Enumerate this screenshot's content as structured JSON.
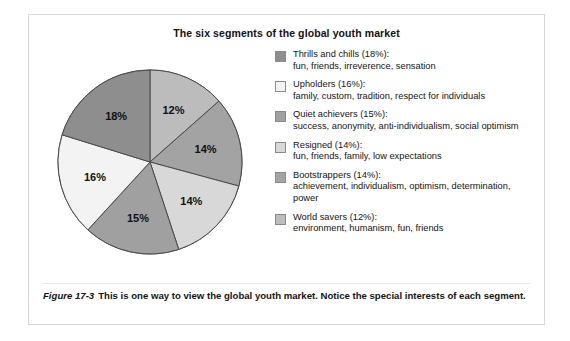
{
  "figure": {
    "title": "The six segments of the global youth market",
    "caption_label": "Figure 17-3",
    "caption_text": "This is one way to view the global youth market. Notice the special interests of each segment."
  },
  "legend": {
    "items": [
      {
        "head": "Thrills and chills (18%):",
        "desc": "fun, friends, irreverence, sensation",
        "color": "#8e8e8e"
      },
      {
        "head": "Upholders (16%):",
        "desc": "family, custom, tradition, respect for individuals",
        "color": "#f3f3f3"
      },
      {
        "head": "Quiet achievers (15%):",
        "desc": "success, anonymity, anti-individualism, social optimism",
        "color": "#a0a0a0"
      },
      {
        "head": "Resigned (14%):",
        "desc": "fun, friends, family, low expectations",
        "color": "#d8d8d8"
      },
      {
        "head": "Bootstrappers (14%):",
        "desc": "achievement, individualism, optimism, determination, power",
        "color": "#a3a3a3"
      },
      {
        "head": "World savers (12%):",
        "desc": "environment, humanism, fun, friends",
        "color": "#bcbcbc"
      }
    ]
  },
  "chart_data": {
    "type": "pie",
    "title": "The six segments of the global youth market",
    "xlabel": "",
    "ylabel": "",
    "legend_position": "right",
    "start_angle_deg": 0,
    "direction": "clockwise",
    "labels_on_slices": true,
    "categories": [
      "World savers",
      "Bootstrappers",
      "Resigned",
      "Quiet achievers",
      "Upholders",
      "Thrills and chills"
    ],
    "values": [
      12,
      14,
      14,
      15,
      16,
      18
    ],
    "value_labels": [
      "12%",
      "14%",
      "14%",
      "15%",
      "16%",
      "18%"
    ],
    "unit": "percent",
    "total": 89,
    "colors": [
      "#bcbcbc",
      "#a3a3a3",
      "#d8d8d8",
      "#a0a0a0",
      "#f3f3f3",
      "#8e8e8e"
    ],
    "descriptions": [
      "environment, humanism, fun, friends",
      "achievement, individualism, optimism, determination, power",
      "fun, friends, family, low expectations",
      "success, anonymity, anti-individualism, social optimism",
      "family, custom, tradition, respect for individuals",
      "fun, friends, irreverence, sensation"
    ]
  }
}
